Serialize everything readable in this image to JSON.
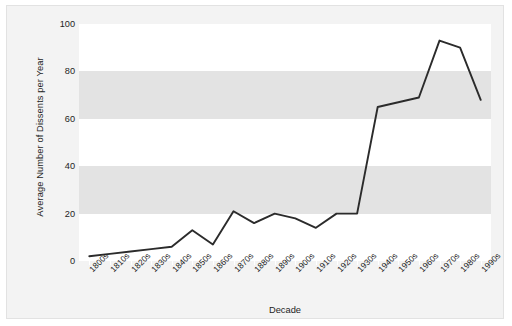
{
  "chart_data": {
    "type": "line",
    "title": "",
    "xlabel": "Decade",
    "ylabel": "Average Number of Dissents per Year",
    "categories": [
      "1800s",
      "1810s",
      "1820s",
      "1830s",
      "1840s",
      "1850s",
      "1860s",
      "1870s",
      "1880s",
      "1890s",
      "1900s",
      "1910s",
      "1920s",
      "1930s",
      "1940s",
      "1950s",
      "1960s",
      "1970s",
      "1980s",
      "1990s"
    ],
    "values": [
      2,
      3,
      4,
      5,
      6,
      13,
      7,
      21,
      16,
      20,
      18,
      14,
      20,
      20,
      65,
      67,
      69,
      93,
      90,
      68
    ],
    "series": [
      {
        "name": "Average Number of Dissents per Year",
        "values": [
          2,
          3,
          4,
          5,
          6,
          13,
          7,
          21,
          16,
          20,
          18,
          14,
          20,
          20,
          65,
          67,
          69,
          93,
          90,
          68
        ]
      }
    ],
    "ylim": [
      0,
      100
    ],
    "yticks": [
      0,
      20,
      40,
      60,
      80,
      100
    ],
    "ytick_labels": [
      "0",
      "20",
      "40",
      "60",
      "80",
      "100"
    ],
    "grid": false,
    "banded_background": true,
    "legend": false,
    "line_color": "#2b2b2b",
    "band_color": "#e3e3e3",
    "plot_background": "#ffffff",
    "figure_background": "#f3f3f3"
  }
}
